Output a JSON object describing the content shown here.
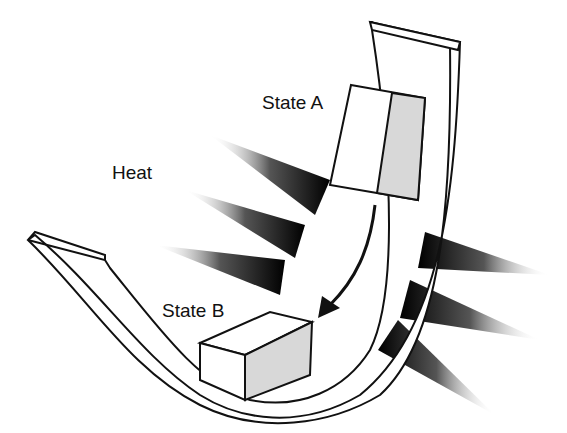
{
  "labels": {
    "state_a": "State A",
    "state_b": "State B",
    "heat": "Heat"
  },
  "colors": {
    "ink": "#111111",
    "shade": "#d8d8d8"
  }
}
